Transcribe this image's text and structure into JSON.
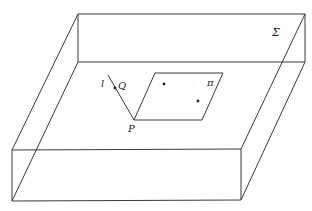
{
  "diagram": {
    "colors": {
      "stroke": "#3a3a3a",
      "background": "#ffffff",
      "text": "#222222"
    },
    "box": {
      "label": "Σ",
      "back_top_left": [
        78,
        14
      ],
      "back_top_right": [
        305,
        14
      ],
      "back_inner_left": [
        78,
        62
      ],
      "back_inner_right": [
        305,
        62
      ],
      "front_top_left": [
        12,
        150
      ],
      "front_top_right": [
        241,
        149
      ],
      "front_bottom_left": [
        12,
        201
      ],
      "front_bottom_right": [
        241,
        200
      ]
    },
    "plane": {
      "label": "π",
      "corners": [
        [
          155,
          73
        ],
        [
          223,
          73
        ],
        [
          202,
          120
        ],
        [
          134,
          120
        ]
      ],
      "points": [
        [
          164,
          84
        ],
        [
          198,
          101
        ]
      ]
    },
    "line": {
      "label": "l",
      "start": [
        108,
        75
      ],
      "end": [
        134,
        120
      ]
    },
    "points": {
      "P": {
        "label": "P",
        "pos": [
          134,
          120
        ]
      },
      "Q": {
        "label": "Q",
        "pos": [
          115,
          88
        ]
      }
    }
  }
}
